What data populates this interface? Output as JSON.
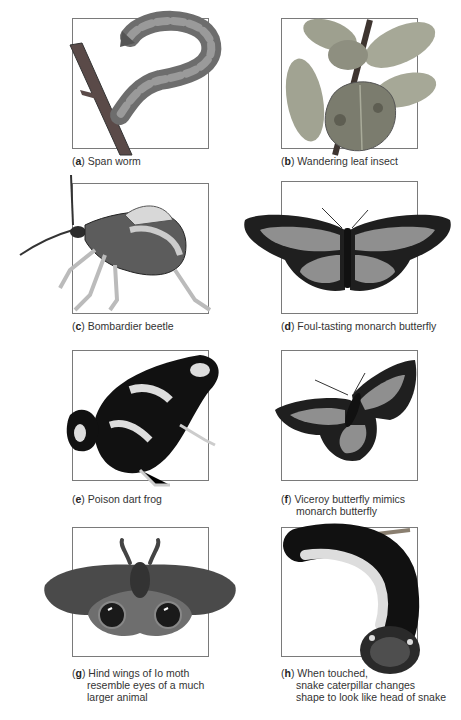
{
  "figure": {
    "panels": [
      {
        "letter": "a",
        "lines": [
          "Span worm"
        ],
        "subject": "span-worm"
      },
      {
        "letter": "b",
        "lines": [
          "Wandering leaf insect"
        ],
        "subject": "wandering-leaf-insect"
      },
      {
        "letter": "c",
        "lines": [
          "Bombardier beetle"
        ],
        "subject": "bombardier-beetle"
      },
      {
        "letter": "d",
        "lines": [
          "Foul-tasting monarch butterfly"
        ],
        "subject": "monarch-butterfly"
      },
      {
        "letter": "e",
        "lines": [
          "Poison dart frog"
        ],
        "subject": "poison-dart-frog"
      },
      {
        "letter": "f",
        "lines": [
          "Viceroy butterfly mimics",
          "monarch butterfly"
        ],
        "subject": "viceroy-butterfly"
      },
      {
        "letter": "g",
        "lines": [
          "Hind wings of Io moth",
          "resemble eyes of a much",
          "larger animal"
        ],
        "subject": "io-moth"
      },
      {
        "letter": "h",
        "lines": [
          "When touched,",
          "snake caterpillar changes",
          "shape to look like head of snake"
        ],
        "subject": "snake-caterpillar"
      }
    ]
  }
}
